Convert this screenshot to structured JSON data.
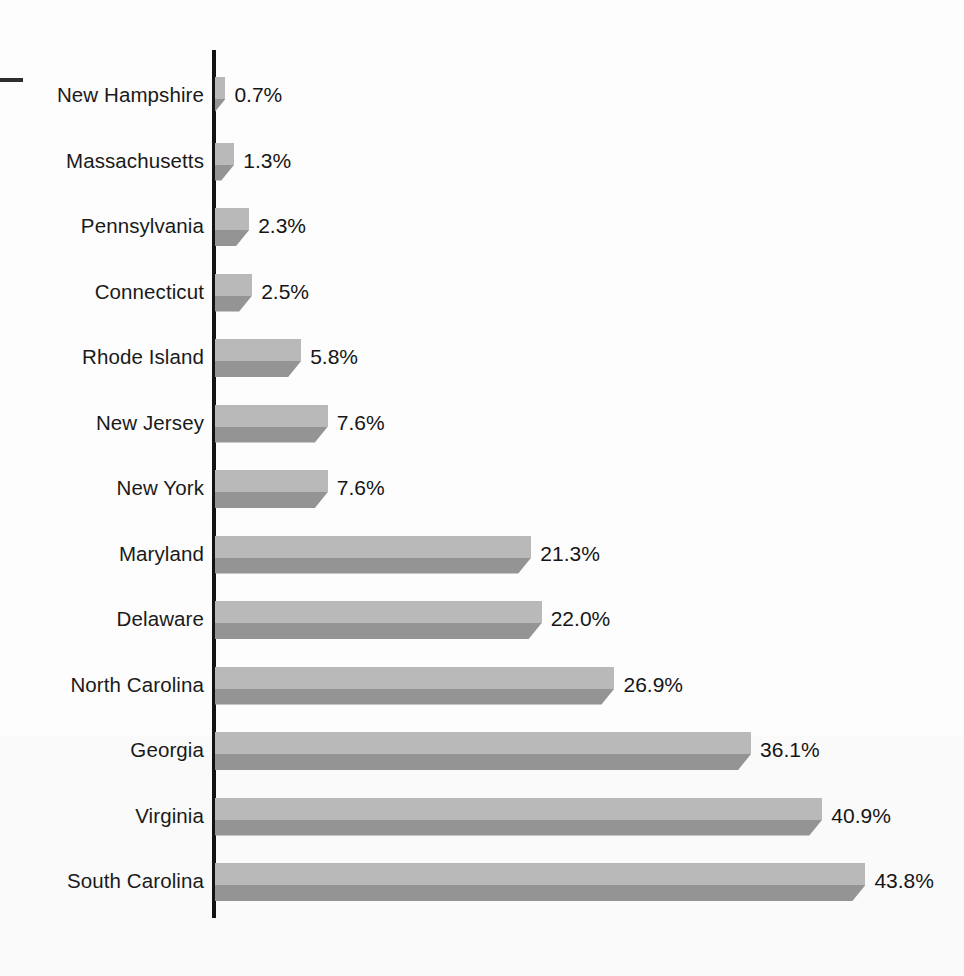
{
  "chart_data": {
    "type": "bar",
    "orientation": "horizontal",
    "title": "",
    "subtitle": "",
    "xlabel": "",
    "ylabel": "",
    "categories": [
      "New Hampshire",
      "Massachusetts",
      "Pennsylvania",
      "Connecticut",
      "Rhode Island",
      "New Jersey",
      "New York",
      "Maryland",
      "Delaware",
      "North Carolina",
      "Georgia",
      "Virginia",
      "South Carolina"
    ],
    "values": [
      0.7,
      1.3,
      2.3,
      2.5,
      5.8,
      7.6,
      7.6,
      21.3,
      22.0,
      26.9,
      36.1,
      40.9,
      43.8
    ],
    "value_labels": [
      "0.7%",
      "1.3%",
      "2.3%",
      "2.5%",
      "5.8%",
      "7.6%",
      "7.6%",
      "21.3%",
      "22.0%",
      "26.9%",
      "36.1%",
      "40.9%",
      "43.8%"
    ],
    "units": "percent",
    "xlim": [
      0,
      43.8
    ],
    "grid": false,
    "legend": null,
    "axis_ticks": [],
    "colors": {
      "bar_light_face": "#b9b9b9",
      "bar_dark_face": "#949494",
      "axis_line": "#131313",
      "label_text": "#1a1a1a",
      "value_text": "#151515",
      "background": "#fefefe"
    },
    "annotations": [
      {
        "name": "left-tick-dash",
        "text": ""
      }
    ]
  },
  "chart": {
    "marks": {
      "dash": ""
    }
  }
}
